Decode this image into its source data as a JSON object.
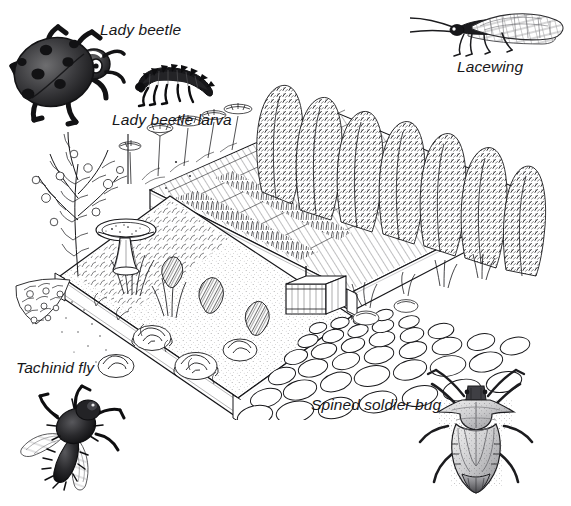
{
  "figure": {
    "background_color": "#ffffff",
    "ink_color": "#17171a",
    "width": 571,
    "height": 506,
    "style": "black and white pen-and-ink line drawing"
  },
  "labels": [
    {
      "id": "lady-beetle",
      "text": "Lady beetle",
      "x": 100,
      "y": 22,
      "align": "left"
    },
    {
      "id": "lady-beetle-larva",
      "text": "Lady beetle larva",
      "x": 112,
      "y": 112,
      "align": "left"
    },
    {
      "id": "lacewing",
      "text": "Lacewing",
      "x": 457,
      "y": 59,
      "align": "left"
    },
    {
      "id": "tachinid-fly",
      "text": "Tachinid fly",
      "x": 16,
      "y": 360,
      "align": "left"
    },
    {
      "id": "spined-soldier-bug",
      "text": "Spined soldier bug",
      "x": 311,
      "y": 397,
      "align": "left"
    }
  ],
  "insects": [
    {
      "id": "lady-beetle",
      "common_name": "Lady beetle",
      "position": "top-left",
      "spot_count": 7,
      "facing": "right"
    },
    {
      "id": "lady-beetle-larva",
      "common_name": "Lady beetle larva",
      "position": "top-center",
      "segments": 9,
      "facing": "left"
    },
    {
      "id": "lacewing",
      "common_name": "Lacewing",
      "position": "top-right",
      "wings": 1,
      "facing": "left"
    },
    {
      "id": "tachinid-fly",
      "common_name": "Tachinid fly",
      "position": "bottom-left",
      "wings": 2,
      "facing": "up-right"
    },
    {
      "id": "spined-soldier-bug",
      "common_name": "Spined soldier bug",
      "position": "bottom-right",
      "shoulder_spines": 2,
      "facing": "up"
    }
  ],
  "garden": {
    "view": "isometric / three-quarter perspective",
    "elements": [
      {
        "id": "raised-bed-front",
        "label": "Front raised bed with lettuce, greens and flowering herbs"
      },
      {
        "id": "raised-bed-back",
        "label": "Back raised bed with carrots, onions, and flowering plants"
      },
      {
        "id": "cobblestone-path",
        "label": "Cobblestone / flagstone path between the beds"
      },
      {
        "id": "birdbath",
        "label": "Pedestal birdbath at the left edge of the front bed"
      },
      {
        "id": "planter-box",
        "label": "Wooden planter box with stake at the path edge"
      },
      {
        "id": "flowering-shrub",
        "label": "Flowering shrub at the far left"
      },
      {
        "id": "trellis-vines",
        "label": "Tall vining plants on trellises along the back"
      },
      {
        "id": "umbel-flowers",
        "label": "Umbel-flowered insectary plants (dill / yarrow) behind the beds"
      },
      {
        "id": "ground-cover",
        "label": "Low flowering ground cover at the left front"
      }
    ]
  }
}
